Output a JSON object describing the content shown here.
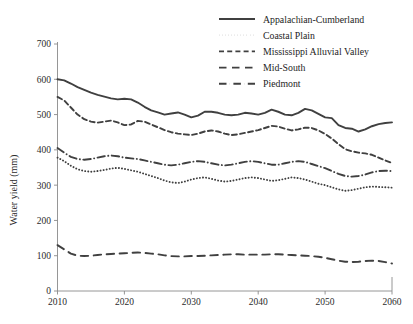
{
  "chart_data": {
    "type": "line",
    "title": "",
    "xlabel": "",
    "ylabel": "Water yield (mm)",
    "xlim": [
      2010,
      2060
    ],
    "ylim": [
      0,
      700
    ],
    "xticks": [
      2010,
      2020,
      2030,
      2040,
      2050,
      2060
    ],
    "yticks": [
      0,
      100,
      200,
      300,
      400,
      500,
      600,
      700
    ],
    "grid": false,
    "legend_position": "top-right",
    "x": [
      2010,
      2011,
      2012,
      2013,
      2014,
      2015,
      2016,
      2017,
      2018,
      2019,
      2020,
      2021,
      2022,
      2023,
      2024,
      2025,
      2026,
      2027,
      2028,
      2029,
      2030,
      2031,
      2032,
      2033,
      2034,
      2035,
      2036,
      2037,
      2038,
      2039,
      2040,
      2041,
      2042,
      2043,
      2044,
      2045,
      2046,
      2047,
      2048,
      2049,
      2050,
      2051,
      2052,
      2053,
      2054,
      2055,
      2056,
      2057,
      2058,
      2059,
      2060
    ],
    "series": [
      {
        "name": "Appalachian-Cumberland",
        "style": "solid",
        "color": "#404040",
        "values": [
          600,
          597,
          588,
          578,
          570,
          562,
          556,
          551,
          546,
          543,
          545,
          543,
          534,
          522,
          512,
          506,
          500,
          503,
          506,
          500,
          492,
          497,
          508,
          508,
          505,
          500,
          498,
          500,
          505,
          503,
          500,
          505,
          514,
          508,
          500,
          498,
          505,
          516,
          512,
          502,
          492,
          490,
          470,
          462,
          460,
          452,
          458,
          467,
          473,
          476,
          478
        ]
      },
      {
        "name": "Coastal Plain",
        "style": "dotted",
        "color": "#404040",
        "values": [
          378,
          368,
          355,
          345,
          340,
          338,
          340,
          343,
          347,
          349,
          346,
          342,
          338,
          332,
          326,
          320,
          313,
          308,
          306,
          310,
          316,
          320,
          322,
          318,
          313,
          310,
          312,
          316,
          320,
          322,
          320,
          316,
          312,
          314,
          318,
          322,
          320,
          316,
          310,
          304,
          300,
          294,
          288,
          284,
          286,
          290,
          294,
          296,
          295,
          294,
          293
        ]
      },
      {
        "name": "Mississippi Alluvial Valley",
        "style": "dashed",
        "color": "#404040",
        "values": [
          550,
          540,
          520,
          500,
          487,
          480,
          477,
          480,
          483,
          478,
          470,
          472,
          482,
          480,
          472,
          464,
          456,
          450,
          446,
          444,
          442,
          446,
          452,
          455,
          452,
          446,
          442,
          444,
          448,
          452,
          456,
          462,
          468,
          466,
          460,
          455,
          458,
          463,
          462,
          455,
          445,
          432,
          416,
          402,
          396,
          392,
          390,
          386,
          378,
          370,
          363
        ]
      },
      {
        "name": "Mid-South",
        "style": "longdash",
        "color": "#404040",
        "values": [
          130,
          118,
          106,
          100,
          99,
          100,
          102,
          104,
          105,
          106,
          107,
          108,
          109,
          108,
          106,
          104,
          101,
          99,
          98,
          98,
          99,
          99,
          100,
          101,
          102,
          103,
          104,
          104,
          103,
          103,
          103,
          103,
          104,
          104,
          103,
          102,
          101,
          100,
          99,
          97,
          94,
          90,
          86,
          83,
          82,
          83,
          85,
          86,
          85,
          82,
          78
        ]
      },
      {
        "name": "Piedmont",
        "style": "dashdot",
        "color": "#404040",
        "values": [
          405,
          392,
          380,
          374,
          372,
          374,
          378,
          382,
          384,
          382,
          378,
          376,
          374,
          370,
          366,
          362,
          358,
          356,
          358,
          362,
          366,
          368,
          366,
          362,
          358,
          356,
          358,
          362,
          366,
          368,
          366,
          362,
          358,
          358,
          362,
          366,
          368,
          366,
          360,
          354,
          348,
          340,
          332,
          326,
          324,
          326,
          330,
          336,
          340,
          341,
          340
        ]
      }
    ]
  },
  "axis": {
    "y_title": "Water yield (mm)",
    "y_ticks": [
      "0",
      "100",
      "200",
      "300",
      "400",
      "500",
      "600",
      "700"
    ],
    "x_ticks": [
      "2010",
      "2020",
      "2030",
      "2040",
      "2050",
      "2060"
    ]
  },
  "legend": {
    "items": [
      {
        "label": "Appalachian-Cumberland",
        "style": "solid"
      },
      {
        "label": "Coastal Plain",
        "style": "dotted"
      },
      {
        "label": "Mississippi Alluvial Valley",
        "style": "dashed"
      },
      {
        "label": "Mid-South",
        "style": "longdash"
      },
      {
        "label": "Piedmont",
        "style": "dashdot"
      }
    ]
  }
}
